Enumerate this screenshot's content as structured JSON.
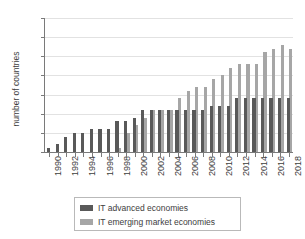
{
  "chart_data": {
    "type": "bar",
    "title": "",
    "xlabel": "",
    "ylabel": "number of countries",
    "ylim": [
      0,
      35
    ],
    "ytick_step": 5,
    "yticks": [
      0,
      5,
      10,
      15,
      20,
      25,
      30,
      35
    ],
    "grid": true,
    "legend_position": "bottom",
    "x_tick_label_step": 2,
    "x_tick_labels": [
      "1990",
      "1992",
      "1994",
      "1996",
      "1998",
      "2000",
      "2002",
      "2004",
      "2006",
      "2008",
      "2010",
      "2012",
      "2014",
      "2016",
      "2018"
    ],
    "categories": [
      "1990",
      "1991",
      "1992",
      "1993",
      "1994",
      "1995",
      "1996",
      "1997",
      "1998",
      "1999",
      "2000",
      "2001",
      "2002",
      "2003",
      "2004",
      "2005",
      "2006",
      "2007",
      "2008",
      "2009",
      "2010",
      "2011",
      "2012",
      "2013",
      "2014",
      "2015",
      "2016",
      "2017",
      "2018"
    ],
    "series": [
      {
        "name": "IT advanced economies",
        "color": "#595959",
        "values": [
          1,
          2,
          4,
          5,
          5,
          6,
          6,
          6,
          8,
          8,
          9,
          11,
          11,
          11,
          11,
          11,
          11,
          11,
          11,
          12,
          12,
          12,
          14,
          14,
          14,
          14,
          14,
          14,
          14
        ]
      },
      {
        "name": "IT emerging market economies",
        "color": "#a6a6a6",
        "values": [
          0,
          0,
          0,
          0,
          0,
          0,
          0,
          0,
          1,
          5,
          7,
          9,
          11,
          11,
          11,
          14,
          16,
          17,
          17,
          19,
          20,
          22,
          23,
          23,
          23,
          26,
          27,
          28,
          27
        ]
      }
    ]
  },
  "legend": {
    "items": [
      {
        "label": "IT advanced economies",
        "color": "#595959"
      },
      {
        "label": "IT emerging market economies",
        "color": "#a6a6a6"
      }
    ]
  }
}
